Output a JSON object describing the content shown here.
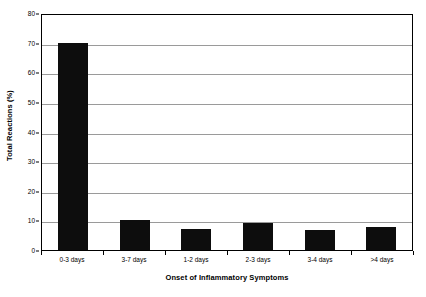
{
  "chart_data": {
    "type": "bar",
    "title": "",
    "xlabel": "Onset of Inflammatory Symptoms",
    "ylabel": "Total Reactions (%)",
    "categories": [
      "0-3 days",
      "3-7 days",
      "1-2 days",
      "2-3 days",
      "3-4 days",
      ">4 days"
    ],
    "values": [
      70,
      10,
      7,
      9,
      6.7,
      7.7
    ],
    "ylim": [
      0,
      80
    ],
    "ytick_labels": [
      "0",
      "10",
      "20",
      "30",
      "40",
      "50",
      "60",
      "70",
      "80"
    ],
    "ytick_values": [
      0,
      10,
      20,
      30,
      40,
      50,
      60,
      70,
      80
    ],
    "grid": true,
    "legend": "none",
    "bar_color": "#0d0d0d",
    "gridline_color": "#9a9a9a",
    "axis_color": "#000000",
    "background_color": "#ffffff"
  }
}
